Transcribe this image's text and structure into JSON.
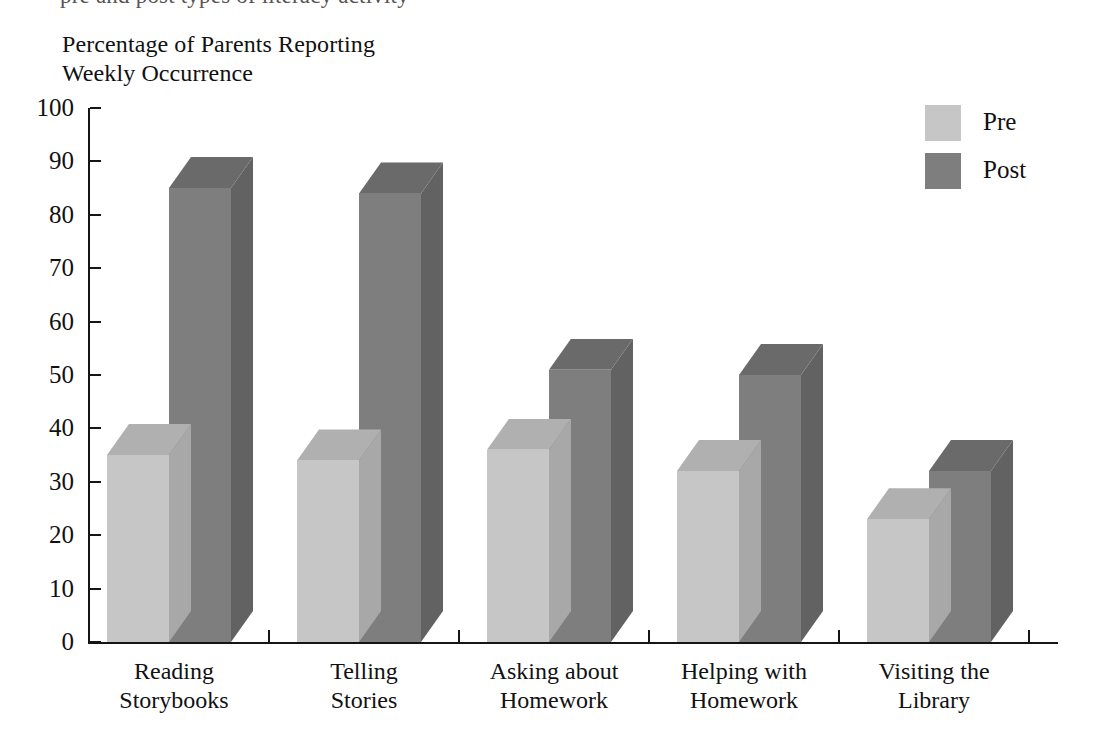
{
  "top_partial_text": "pre and post types of literacy activity",
  "chart_data": {
    "type": "bar",
    "title": "Percentage of Parents Reporting\nWeekly Occurrence",
    "title_line1": "Percentage of Parents Reporting",
    "title_line2": "Weekly Occurrence",
    "xlabel": "",
    "ylabel": "",
    "ylim": [
      0,
      100
    ],
    "ytick_labels": [
      "0",
      "10",
      "20",
      "30",
      "40",
      "50",
      "60",
      "70",
      "80",
      "90",
      "100"
    ],
    "ytick_values": [
      0,
      10,
      20,
      30,
      40,
      50,
      60,
      70,
      80,
      90,
      100
    ],
    "grid": false,
    "legend_position": "top-right",
    "style": "3d-column",
    "categories": [
      "Reading Storybooks",
      "Telling Stories",
      "Asking about Homework",
      "Helping with Homework",
      "Visiting the Library"
    ],
    "category_lines": [
      [
        "Reading",
        "Storybooks"
      ],
      [
        "Telling",
        "Stories"
      ],
      [
        "Asking about",
        "Homework"
      ],
      [
        "Helping with",
        "Homework"
      ],
      [
        "Visiting the",
        "Library"
      ]
    ],
    "series": [
      {
        "name": "Pre",
        "values": [
          35,
          34,
          36,
          32,
          23
        ],
        "color": "#c6c6c6"
      },
      {
        "name": "Post",
        "values": [
          85,
          84,
          51,
          50,
          32
        ],
        "color": "#7e7e7e"
      }
    ]
  },
  "legend": {
    "items": [
      {
        "label": "Pre",
        "color": "#c6c6c6"
      },
      {
        "label": "Post",
        "color": "#7e7e7e"
      }
    ]
  },
  "colors": {
    "pre_front": "#c6c6c6",
    "pre_top": "#b0b0b0",
    "pre_side": "#a8a8a8",
    "post_front": "#7e7e7e",
    "post_top": "#6a6a6a",
    "post_side": "#626262",
    "axis": "#151515",
    "text": "#111111",
    "background": "#ffffff"
  }
}
